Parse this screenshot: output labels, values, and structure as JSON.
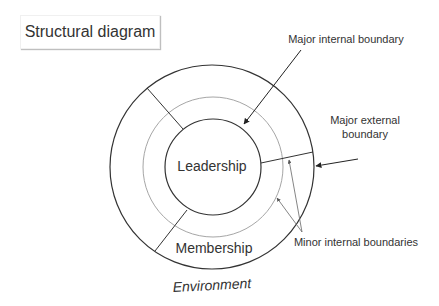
{
  "title": "Structural diagram",
  "labels": {
    "leadership": "Leadership",
    "membership": "Membership",
    "environment": "Environment",
    "major_internal": "Major internal boundary",
    "major_external_line1": "Major external",
    "major_external_line2": "boundary",
    "minor_internal": "Minor internal boundaries"
  },
  "colors": {
    "line": "#333333",
    "minor_circle": "#a6a6a6",
    "text": "#333333"
  }
}
